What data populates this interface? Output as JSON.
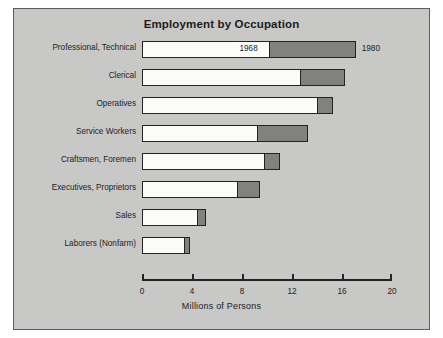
{
  "chart_data": {
    "type": "bar",
    "orientation": "horizontal",
    "stacked_overlay": true,
    "title": "Employment by Occupation",
    "xlabel": "Millions of Persons",
    "ylabel": "",
    "xlim": [
      0,
      20
    ],
    "xticks": [
      0,
      4,
      8,
      12,
      16,
      20
    ],
    "xtick_labels": [
      "0",
      "4",
      "8",
      "12",
      "16",
      "20"
    ],
    "grid": false,
    "legend_position": "in-plot-annotation",
    "categories": [
      "Professional, Technical",
      "Clerical",
      "Operatives",
      "Service Workers",
      "Craftsmen, Foremen",
      "Executives, Proprietors",
      "Sales",
      "Laborers (Nonfarm)"
    ],
    "series": [
      {
        "name": "1968",
        "color": "#fbfbf9",
        "values": [
          10.2,
          12.7,
          14.1,
          9.3,
          9.8,
          7.7,
          4.5,
          3.4
        ]
      },
      {
        "name": "1980",
        "color": "#81817f",
        "values": [
          17.1,
          16.2,
          15.3,
          13.3,
          11.0,
          9.4,
          5.1,
          3.8
        ]
      }
    ],
    "annotations": [
      {
        "text": "1968",
        "category": "Professional, Technical",
        "series": "1968"
      },
      {
        "text": "1980",
        "category": "Professional, Technical",
        "series": "1980"
      }
    ]
  },
  "colors": {
    "plate_background": "#c8c8c6",
    "plate_border": "#5d5d5b",
    "bar_outline": "#232323",
    "series_1968": "#fbfbf9",
    "series_1980": "#81817f",
    "text": "#1d1d1d"
  }
}
